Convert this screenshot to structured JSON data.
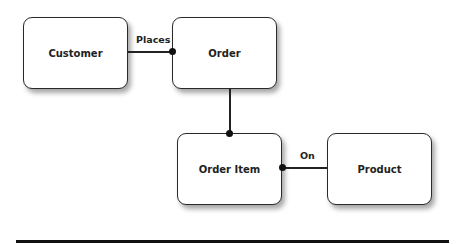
{
  "entities": [
    {
      "id": "customer",
      "label": "Customer"
    },
    {
      "id": "order",
      "label": "Order"
    },
    {
      "id": "order_item",
      "label": "Order Item"
    },
    {
      "id": "product",
      "label": "Product"
    }
  ],
  "relationships": [
    {
      "from": "Customer",
      "to": "Order",
      "label": "Places",
      "many_end": "Order"
    },
    {
      "from": "Order",
      "to": "Order Item",
      "label": "",
      "many_end": "Order Item"
    },
    {
      "from": "Product",
      "to": "Order Item",
      "label": "On",
      "many_end": "Order Item"
    }
  ],
  "colors": {
    "stroke": "#222222",
    "background": "#ffffff"
  }
}
